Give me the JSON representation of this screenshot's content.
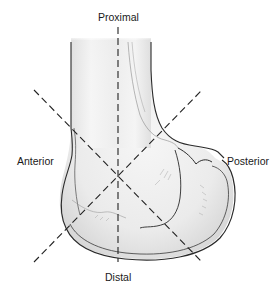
{
  "figure": {
    "labels": {
      "top": "Proximal",
      "left": "Anterior",
      "right": "Posterior",
      "bottom": "Distal"
    },
    "axes": [
      {
        "name": "proximal-distal axis",
        "style": "dashed",
        "from": [
          118,
          27
        ],
        "to": [
          118,
          262
        ]
      },
      {
        "name": "anterior-proximal to posterior-distal axis",
        "style": "dashed",
        "from": [
          34,
          90
        ],
        "to": [
          202,
          262
        ]
      },
      {
        "name": "anterior-distal to posterior-proximal axis",
        "style": "dashed",
        "from": [
          34,
          262
        ],
        "to": [
          202,
          90
        ]
      }
    ],
    "intersection": [
      118,
      175
    ],
    "colors": {
      "outline": "#2a2a2a",
      "bone_fill": "#ececec",
      "shading": "#bdbdbd",
      "dash": "#222222",
      "text": "#1a1a1a",
      "background": "#ffffff"
    }
  }
}
